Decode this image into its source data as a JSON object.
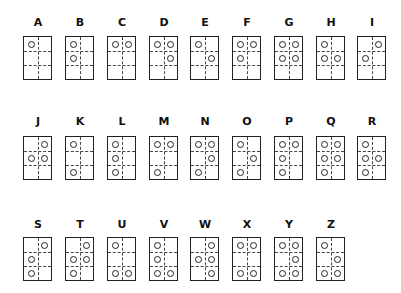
{
  "chart_title": "",
  "layout": {
    "col_x": [
      23,
      65,
      107,
      149,
      190,
      232,
      274,
      316,
      357
    ],
    "rows": [
      {
        "letter_y": 17,
        "box_y": 36
      },
      {
        "letter_y": 116,
        "box_y": 136
      },
      {
        "letter_y": 219,
        "box_y": 237
      }
    ]
  },
  "letters": [
    {
      "char": "A",
      "dots": [
        1
      ]
    },
    {
      "char": "B",
      "dots": [
        1,
        2
      ]
    },
    {
      "char": "C",
      "dots": [
        1,
        4
      ]
    },
    {
      "char": "D",
      "dots": [
        1,
        4,
        5
      ]
    },
    {
      "char": "E",
      "dots": [
        1,
        5
      ]
    },
    {
      "char": "F",
      "dots": [
        1,
        2,
        4
      ]
    },
    {
      "char": "G",
      "dots": [
        1,
        2,
        4,
        5
      ]
    },
    {
      "char": "H",
      "dots": [
        1,
        2,
        5
      ]
    },
    {
      "char": "I",
      "dots": [
        2,
        4
      ]
    },
    {
      "char": "J",
      "dots": [
        2,
        4,
        5
      ]
    },
    {
      "char": "K",
      "dots": [
        1,
        3
      ]
    },
    {
      "char": "L",
      "dots": [
        1,
        2,
        3
      ]
    },
    {
      "char": "M",
      "dots": [
        1,
        3,
        4
      ]
    },
    {
      "char": "N",
      "dots": [
        1,
        3,
        4,
        5
      ]
    },
    {
      "char": "O",
      "dots": [
        1,
        3,
        5
      ]
    },
    {
      "char": "P",
      "dots": [
        1,
        2,
        3,
        4
      ]
    },
    {
      "char": "Q",
      "dots": [
        1,
        2,
        3,
        4,
        5
      ]
    },
    {
      "char": "R",
      "dots": [
        1,
        2,
        3,
        5
      ]
    },
    {
      "char": "S",
      "dots": [
        2,
        3,
        4
      ]
    },
    {
      "char": "T",
      "dots": [
        2,
        3,
        4,
        5
      ]
    },
    {
      "char": "U",
      "dots": [
        1,
        3,
        6
      ]
    },
    {
      "char": "V",
      "dots": [
        1,
        2,
        3,
        6
      ]
    },
    {
      "char": "W",
      "dots": [
        2,
        4,
        5,
        6
      ]
    },
    {
      "char": "X",
      "dots": [
        1,
        3,
        4,
        6
      ]
    },
    {
      "char": "Y",
      "dots": [
        1,
        3,
        4,
        5,
        6
      ]
    },
    {
      "char": "Z",
      "dots": [
        1,
        3,
        5,
        6
      ]
    }
  ]
}
